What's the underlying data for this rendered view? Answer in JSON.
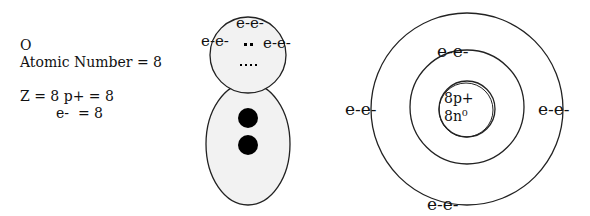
{
  "info": {
    "symbol": "O",
    "atomic_number": "Atomic Number = 8",
    "z_protons": "Z = 8 p+ = 8",
    "electrons": "e-  = 8"
  },
  "lewis_figure": {
    "top_left": "e-e-",
    "top": "e-e-",
    "top_right": "e-e-",
    "dots_pair": "▪▪",
    "dots_row": "....",
    "colors": {
      "fill": "#f2f2f2",
      "stroke": "#222222",
      "dot": "#000000"
    }
  },
  "bohr_model": {
    "nucleus_line1": "8p+",
    "nucleus_line2": "8n⁰",
    "inner_shell_top": "e-e-",
    "outer_left": "e-e-",
    "outer_right": "e-e-",
    "outer_bottom": "e-e-"
  }
}
